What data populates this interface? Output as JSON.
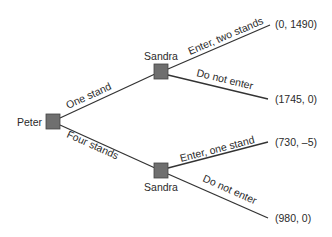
{
  "diagram": {
    "type": "game-tree",
    "colors": {
      "node_fill": "#6f6f6f",
      "edge": "#333333",
      "text": "#2a2a2a"
    },
    "nodes": [
      {
        "id": "peter",
        "player": "Peter"
      },
      {
        "id": "sandra_top",
        "player": "Sandra"
      },
      {
        "id": "sandra_bottom",
        "player": "Sandra"
      }
    ],
    "edges": [
      {
        "from": "peter",
        "to": "sandra_top",
        "label": "One stand"
      },
      {
        "from": "peter",
        "to": "sandra_bottom",
        "label": "Four stands"
      },
      {
        "from": "sandra_top",
        "to": "payoff_1",
        "label": "Enter, two stands"
      },
      {
        "from": "sandra_top",
        "to": "payoff_2",
        "label": "Do not enter"
      },
      {
        "from": "sandra_bottom",
        "to": "payoff_3",
        "label": "Enter, one stand"
      },
      {
        "from": "sandra_bottom",
        "to": "payoff_4",
        "label": "Do not enter"
      }
    ],
    "payoffs": [
      {
        "id": "payoff_1",
        "text": "(0, 1490)"
      },
      {
        "id": "payoff_2",
        "text": "(1745, 0)"
      },
      {
        "id": "payoff_3",
        "text": "(730, –5)"
      },
      {
        "id": "payoff_4",
        "text": "(980, 0)"
      }
    ]
  }
}
